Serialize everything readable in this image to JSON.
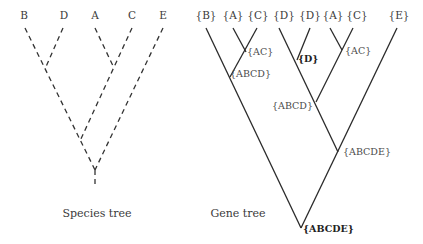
{
  "species_tree": {
    "caption": "Species tree",
    "leaves": [
      "B",
      "D",
      "A",
      "C",
      "E"
    ],
    "style": "dashed"
  },
  "gene_tree": {
    "caption": "Gene tree",
    "leaves": [
      "{B}",
      "{A}",
      "{C}",
      "{D}",
      "{D}",
      "{A}",
      "{C}",
      "{E}"
    ],
    "nodes": {
      "ac_left": "{AC}",
      "abcd_left": "{ABCD}",
      "d_mid": "{D}",
      "ac_right": "{AC}",
      "abcd_mid": "{ABCD}",
      "abcde_inner": "{ABCDE}",
      "abcde_root": "{ABCDE}"
    },
    "style": "solid"
  },
  "colors": {
    "line": "#333333",
    "text": "#3a3a3a"
  }
}
